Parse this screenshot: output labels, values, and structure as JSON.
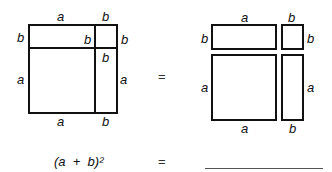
{
  "figure_left": {
    "labels": {
      "top_a": "a",
      "top_b": "b",
      "left_b": "b",
      "inner_b": "b",
      "right_b": "b",
      "inner_b2": "b",
      "left_a": "a",
      "right_a": "a",
      "bottom_a": "a",
      "bottom_b": "b"
    }
  },
  "equals_1": "=",
  "figure_right": {
    "labels": {
      "top_a": "a",
      "top_b": "b",
      "left_b": "b",
      "right_b": "b",
      "left_a": "a",
      "right_a": "a",
      "bottom_a": "a",
      "bottom_b": "b"
    }
  },
  "equation": {
    "lhs": "(a  +  b)²",
    "equals": "=",
    "answer": ""
  }
}
